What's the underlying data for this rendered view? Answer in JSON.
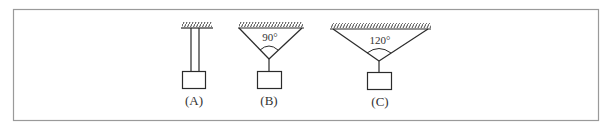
{
  "diagram": {
    "figures": [
      {
        "id": "A",
        "label": "(A)",
        "angle_label": ""
      },
      {
        "id": "B",
        "label": "(B)",
        "angle_label": "90°"
      },
      {
        "id": "C",
        "label": "(C)",
        "angle_label": "120°"
      }
    ]
  },
  "colors": {
    "stroke": "#2b2b2b",
    "frame": "#9a9a9a",
    "background": "#ffffff"
  }
}
